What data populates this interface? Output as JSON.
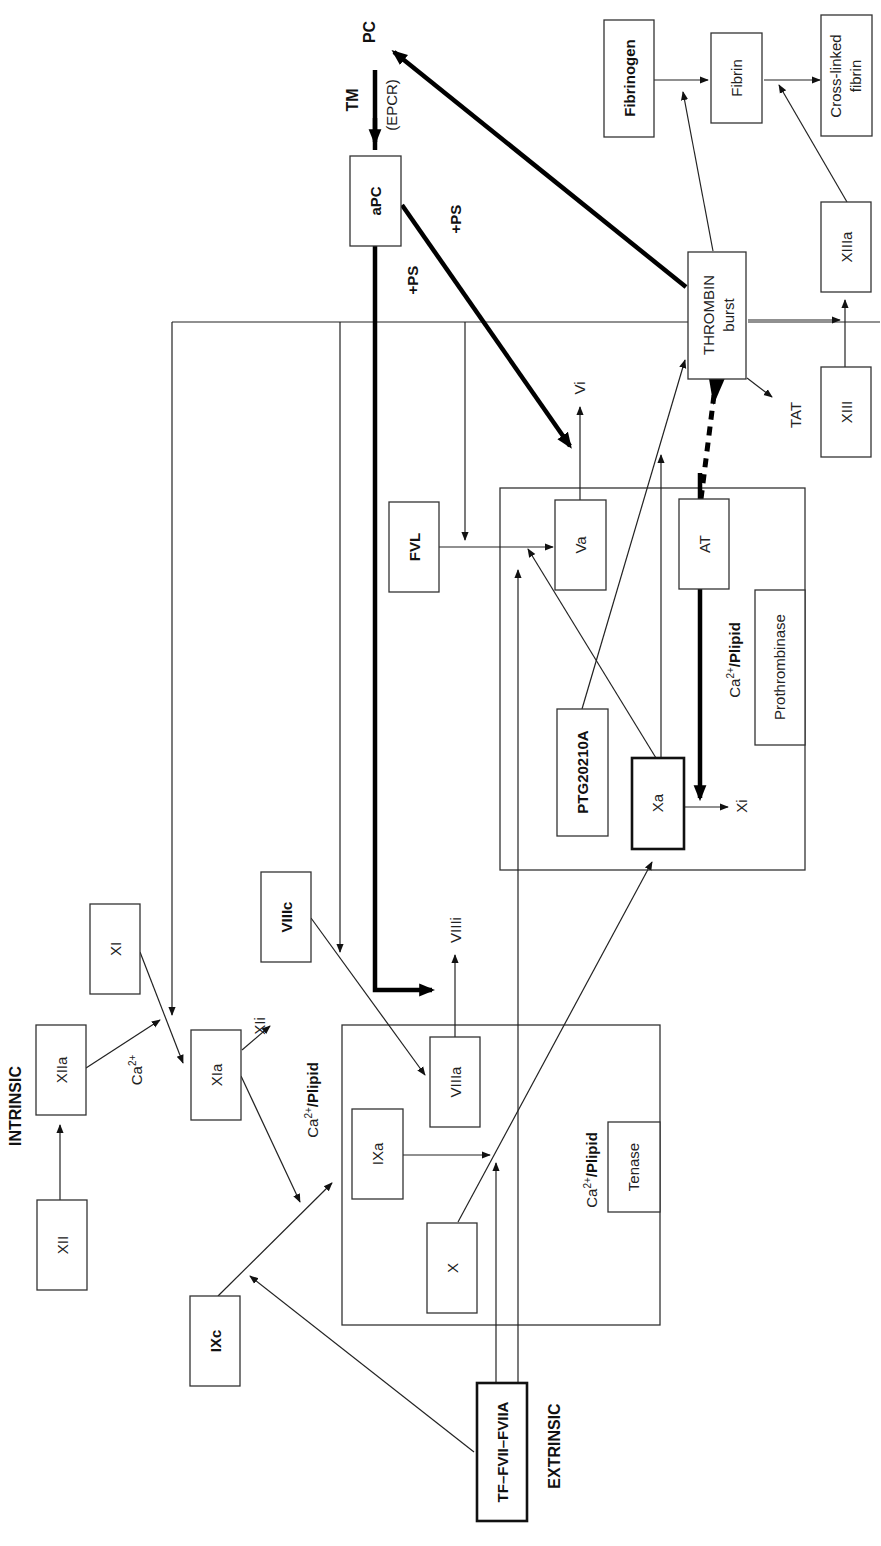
{
  "pathways": {
    "intrinsic": "INTRINSIC",
    "extrinsic": "EXTRINSIC"
  },
  "nodes": {
    "xii": "XII",
    "xiia": "XIIa",
    "xi": "XI",
    "xia": "XIa",
    "xii_inactive": "XIi",
    "ixc": "IXc",
    "ixa": "IXa",
    "x": "X",
    "viiia": "VIIIa",
    "viiic": "VIIIc",
    "viiii": "VIIIi",
    "tf_fvii": "TF–FVII–FVIIA",
    "xa": "Xa",
    "xi_inactive": "Xi",
    "ptg": "PTG20210A",
    "va": "Va",
    "vi": "Vi",
    "fvl": "FVL",
    "at": "AT",
    "thrombin_line1": "THROMBIN",
    "thrombin_line2": "burst",
    "tat": "TAT",
    "apc": "aPC",
    "pc": "PC",
    "tm": "TM",
    "epcr": "(EPCR)",
    "ps1": "+PS",
    "ps2": "+PS",
    "xiii": "XIII",
    "xiiia": "XIIIa",
    "fibrinogen": "Fibrinogen",
    "fibrin": "Fibrin",
    "crosslinked_line1": "Cross-linked",
    "crosslinked_line2": "fibrin"
  },
  "cofactors": {
    "ca_base": "Ca",
    "ca_sup": "2+",
    "plipid": "/Plipid",
    "ca_only_sup": "2+"
  },
  "complexes": {
    "tenase": "Tenase",
    "prothrombinase": "Prothrombinase"
  },
  "colors": {
    "line": "#222222",
    "thick_line": "#000000",
    "background": "#ffffff"
  }
}
